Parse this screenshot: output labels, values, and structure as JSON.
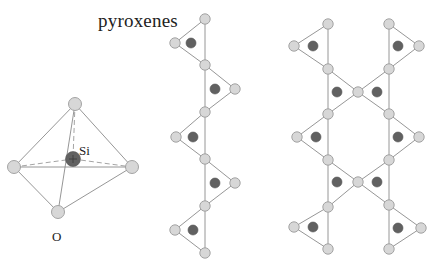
{
  "figure": {
    "title": "pyroxenes",
    "colors": {
      "oxygen_fill": "#d7d7d7",
      "oxygen_stroke": "#9b9b9b",
      "silicon_fill": "#616161",
      "bond_line": "#8a8a8a",
      "background": "#ffffff"
    }
  },
  "tetrahedron": {
    "silicon_label": "Si",
    "oxygen_label": "O",
    "oxygens": [
      [
        75,
        104
      ],
      [
        14,
        167
      ],
      [
        132,
        167
      ],
      [
        58,
        212
      ]
    ],
    "silicon": [
      73,
      159
    ]
  },
  "single_chain": {
    "description": "single chain of SiO4 tetrahedra",
    "spine_x": 205,
    "spine_nodes_y": [
      19,
      65,
      112,
      159,
      206,
      253
    ],
    "apexes": [
      [
        175,
        43
      ],
      [
        235,
        89
      ],
      [
        176,
        137
      ],
      [
        235,
        183
      ],
      [
        175,
        230
      ]
    ],
    "silicons": [
      [
        191,
        43
      ],
      [
        215,
        89
      ],
      [
        193,
        137
      ],
      [
        215,
        183
      ],
      [
        193,
        230
      ]
    ]
  },
  "double_chain": {
    "description": "double chain of SiO4 tetrahedra",
    "left_spine_x": 328,
    "right_spine_x": 389,
    "left_nodes_y": [
      24,
      69,
      114,
      160,
      207,
      249
    ],
    "right_nodes_y": [
      24,
      69,
      114,
      160,
      205,
      249
    ],
    "center_nodes": [
      [
        358,
        92
      ],
      [
        358,
        182
      ]
    ],
    "left_apexes": [
      [
        294,
        46
      ],
      [
        297,
        137
      ],
      [
        294,
        227
      ]
    ],
    "right_apexes": [
      [
        419,
        46
      ],
      [
        419,
        137
      ],
      [
        421,
        228
      ]
    ],
    "silicons": [
      [
        313,
        46
      ],
      [
        398,
        46
      ],
      [
        337,
        92
      ],
      [
        377,
        92
      ],
      [
        316,
        137
      ],
      [
        398,
        137
      ],
      [
        337,
        182
      ],
      [
        377,
        182
      ],
      [
        313,
        227
      ],
      [
        398,
        228
      ]
    ]
  }
}
